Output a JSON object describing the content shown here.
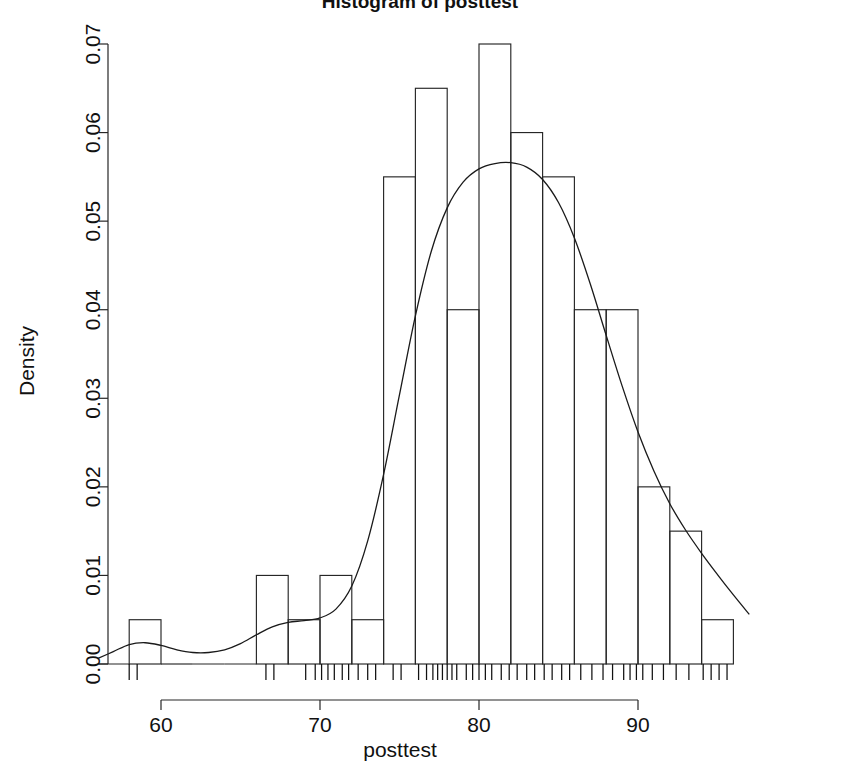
{
  "chart_data": {
    "type": "bar",
    "title": "Histogram of posttest",
    "xlabel": "posttest",
    "ylabel": "Density",
    "xlim": [
      56,
      96
    ],
    "ylim": [
      0.0,
      0.07
    ],
    "xticks": [
      60,
      70,
      80,
      90
    ],
    "xtick_labels": [
      "60",
      "70",
      "80",
      "90"
    ],
    "yticks": [
      0.0,
      0.01,
      0.02,
      0.03,
      0.04,
      0.05,
      0.06,
      0.07
    ],
    "ytick_labels": [
      "0.00",
      "0.01",
      "0.02",
      "0.03",
      "0.04",
      "0.05",
      "0.06",
      "0.07"
    ],
    "grid": false,
    "legend": "none",
    "bin_width": 2,
    "bin_edges": [
      56,
      58,
      60,
      62,
      64,
      66,
      68,
      70,
      72,
      74,
      76,
      78,
      80,
      82,
      84,
      86,
      88,
      90,
      92,
      94,
      96
    ],
    "bin_labels": [
      "56-58",
      "58-60",
      "60-62",
      "62-64",
      "64-66",
      "66-68",
      "68-70",
      "70-72",
      "72-74",
      "74-76",
      "76-78",
      "78-80",
      "80-82",
      "82-84",
      "84-86",
      "86-88",
      "88-90",
      "90-92",
      "92-94",
      "94-96"
    ],
    "categories": [
      "57",
      "59",
      "61",
      "63",
      "65",
      "67",
      "69",
      "71",
      "73",
      "75",
      "77",
      "79",
      "81",
      "83",
      "85",
      "87",
      "89",
      "91",
      "93",
      "95"
    ],
    "values": [
      0.0,
      0.005,
      0.0,
      0.0,
      0.0,
      0.01,
      0.005,
      0.01,
      0.005,
      0.055,
      0.065,
      0.04,
      0.07,
      0.06,
      0.055,
      0.04,
      0.04,
      0.02,
      0.015,
      0.005
    ],
    "series": [
      {
        "name": "Density histogram",
        "values": [
          0.0,
          0.005,
          0.0,
          0.0,
          0.0,
          0.01,
          0.005,
          0.01,
          0.005,
          0.055,
          0.065,
          0.04,
          0.07,
          0.06,
          0.055,
          0.04,
          0.04,
          0.02,
          0.015,
          0.005
        ]
      },
      {
        "name": "Kernel density estimate",
        "x": [
          56,
          57,
          58,
          59,
          60,
          61,
          62,
          63,
          64,
          65,
          66,
          67,
          68,
          69,
          70,
          71,
          72,
          73,
          74,
          75,
          76,
          77,
          78,
          79,
          80,
          81,
          82,
          83,
          84,
          85,
          86,
          87,
          88,
          89,
          90,
          91,
          92,
          93,
          94,
          95,
          96,
          97
        ],
        "values": [
          0.0006,
          0.0014,
          0.0022,
          0.0024,
          0.0021,
          0.0016,
          0.0013,
          0.0013,
          0.0016,
          0.0023,
          0.0033,
          0.0042,
          0.0047,
          0.0049,
          0.0052,
          0.0062,
          0.0088,
          0.0139,
          0.0214,
          0.0304,
          0.0393,
          0.0466,
          0.0515,
          0.0544,
          0.0559,
          0.0565,
          0.0566,
          0.0561,
          0.0547,
          0.0521,
          0.0481,
          0.0429,
          0.0371,
          0.0314,
          0.0262,
          0.0218,
          0.0181,
          0.0151,
          0.0125,
          0.0101,
          0.0078,
          0.0056
        ]
      }
    ],
    "rug_values": [
      58.0,
      58.5,
      66.6,
      67.1,
      69.1,
      69.7,
      70.1,
      70.5,
      70.9,
      71.4,
      71.8,
      72.4,
      73.0,
      73.5,
      74.6,
      75.1,
      76.2,
      76.7,
      77.1,
      77.4,
      77.7,
      78.0,
      78.3,
      78.6,
      79.2,
      79.6,
      80.0,
      80.4,
      80.8,
      81.4,
      81.9,
      82.4,
      83.0,
      83.5,
      84.1,
      84.6,
      85.2,
      85.7,
      86.4,
      87.1,
      87.8,
      88.4,
      89.1,
      89.5,
      89.9,
      90.3,
      90.9,
      91.6,
      92.4,
      93.2,
      94.1,
      94.6,
      95.1,
      95.6
    ]
  },
  "axes": {
    "y_title": "Density",
    "x_title": "posttest",
    "title": "Histogram of posttest"
  }
}
